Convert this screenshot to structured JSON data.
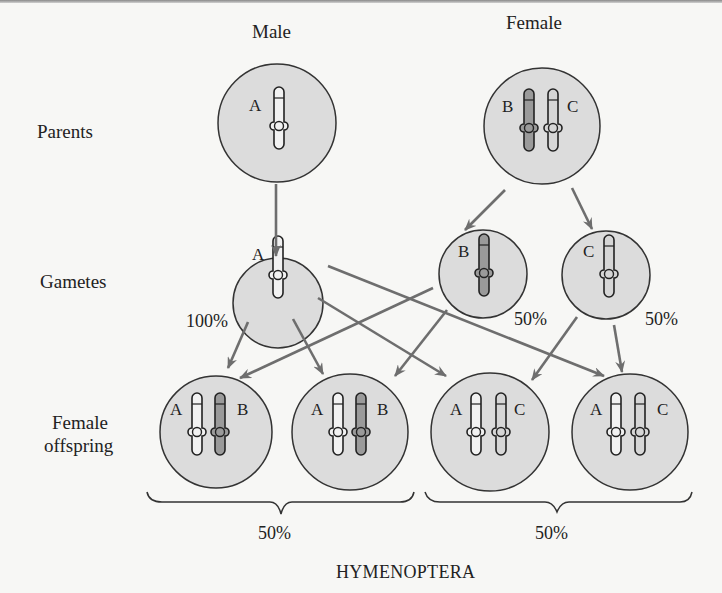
{
  "diagram": {
    "title": "HYMENOPTERA",
    "column_labels": {
      "male": "Male",
      "female": "Female"
    },
    "row_labels": {
      "parents": "Parents",
      "gametes": "Gametes",
      "offspring_line1": "Female",
      "offspring_line2": "offspring"
    },
    "parents": {
      "male": {
        "alleles": [
          "A"
        ]
      },
      "female": {
        "alleles": [
          "B",
          "C"
        ]
      }
    },
    "gametes": [
      {
        "allele": "A",
        "frequency": "100%"
      },
      {
        "allele": "B",
        "frequency": "50%"
      },
      {
        "allele": "C",
        "frequency": "50%"
      }
    ],
    "offspring": [
      {
        "alleles": [
          "A",
          "B"
        ]
      },
      {
        "alleles": [
          "A",
          "B"
        ]
      },
      {
        "alleles": [
          "A",
          "C"
        ]
      },
      {
        "alleles": [
          "A",
          "C"
        ]
      }
    ],
    "offspring_groups": [
      {
        "genotype": "AB",
        "frequency": "50%"
      },
      {
        "genotype": "AC",
        "frequency": "50%"
      }
    ],
    "colors": {
      "cell_fill": "#dcdcdc",
      "cell_stroke": "#333333",
      "chromosome_light": "#f2f2f2",
      "chromosome_B": "#9a9a9a",
      "chromosome_C": "#d6d6d6",
      "arrow": "#6e6e6e",
      "background": "#f7f7f5"
    }
  }
}
